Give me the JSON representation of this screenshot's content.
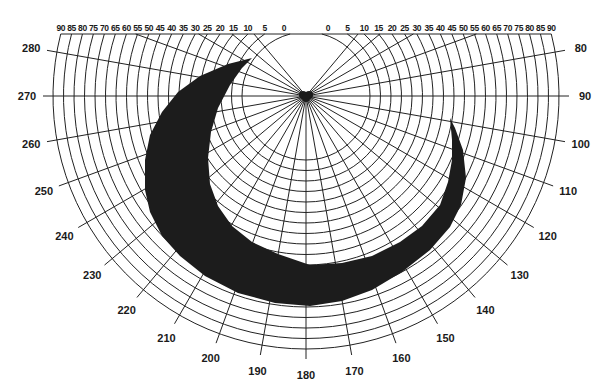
{
  "diagram": {
    "type": "polar-visual-field-chart",
    "center": {
      "x": 306,
      "y": 96
    },
    "top_clip_y": 34,
    "ring_start_radius": 64,
    "ring_step_px": 10.5,
    "ring_values_deg": [
      0,
      5,
      10,
      15,
      20,
      25,
      30,
      35,
      40,
      45,
      50,
      55,
      60,
      65,
      70,
      75,
      80,
      85,
      90
    ],
    "top_labels_left": [
      "90",
      "85",
      "80",
      "75",
      "70",
      "65",
      "60",
      "55",
      "50",
      "45",
      "40",
      "35",
      "30",
      "25",
      "20",
      "15",
      "10",
      "5",
      "0"
    ],
    "top_labels_right": [
      "0",
      "5",
      "10",
      "15",
      "20",
      "25",
      "30",
      "35",
      "40",
      "45",
      "50",
      "55",
      "60",
      "65",
      "70",
      "75",
      "80",
      "85",
      "90"
    ],
    "meridian_labels": [
      {
        "label": "80",
        "angle": 80
      },
      {
        "label": "90",
        "angle": 90
      },
      {
        "label": "100",
        "angle": 100
      },
      {
        "label": "110",
        "angle": 110
      },
      {
        "label": "120",
        "angle": 120
      },
      {
        "label": "130",
        "angle": 130
      },
      {
        "label": "140",
        "angle": 140
      },
      {
        "label": "150",
        "angle": 150
      },
      {
        "label": "160",
        "angle": 160
      },
      {
        "label": "170",
        "angle": 170
      },
      {
        "label": "180",
        "angle": 180
      },
      {
        "label": "190",
        "angle": 190
      },
      {
        "label": "200",
        "angle": 200
      },
      {
        "label": "210",
        "angle": 210
      },
      {
        "label": "220",
        "angle": 220
      },
      {
        "label": "230",
        "angle": 230
      },
      {
        "label": "240",
        "angle": 240
      },
      {
        "label": "250",
        "angle": 250
      },
      {
        "label": "260",
        "angle": 260
      },
      {
        "label": "270",
        "angle": 270
      },
      {
        "label": "280",
        "angle": 280
      }
    ],
    "upper_short_rays_deg": [
      40,
      50,
      60,
      70,
      290,
      300,
      310,
      320
    ],
    "field_defect": {
      "shape": "crescent",
      "color": "#1c1c1c",
      "outline_points": [
        [
          252,
          58
        ],
        [
          228,
          64
        ],
        [
          200,
          76
        ],
        [
          178,
          92
        ],
        [
          162,
          112
        ],
        [
          150,
          135
        ],
        [
          145,
          160
        ],
        [
          145,
          190
        ],
        [
          150,
          212
        ],
        [
          162,
          236
        ],
        [
          180,
          256
        ],
        [
          205,
          276
        ],
        [
          238,
          293
        ],
        [
          275,
          303
        ],
        [
          310,
          306
        ],
        [
          342,
          301
        ],
        [
          372,
          290
        ],
        [
          402,
          272
        ],
        [
          430,
          250
        ],
        [
          450,
          227
        ],
        [
          461,
          205
        ],
        [
          466,
          178
        ],
        [
          463,
          150
        ],
        [
          455,
          128
        ],
        [
          450,
          118
        ],
        [
          452,
          140
        ],
        [
          452,
          160
        ],
        [
          448,
          182
        ],
        [
          440,
          205
        ],
        [
          422,
          226
        ],
        [
          400,
          242
        ],
        [
          372,
          256
        ],
        [
          342,
          263
        ],
        [
          310,
          265
        ],
        [
          278,
          254
        ],
        [
          252,
          242
        ],
        [
          232,
          226
        ],
        [
          218,
          206
        ],
        [
          210,
          184
        ],
        [
          208,
          158
        ],
        [
          211,
          132
        ],
        [
          218,
          108
        ],
        [
          230,
          85
        ],
        [
          242,
          68
        ]
      ]
    }
  }
}
